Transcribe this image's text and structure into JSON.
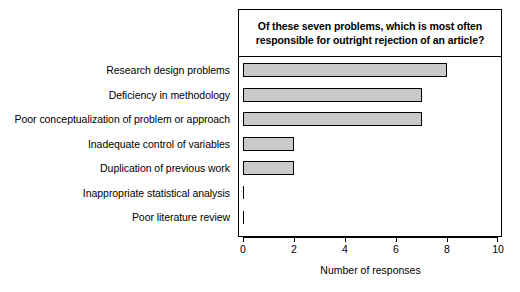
{
  "chart_data": {
    "type": "bar",
    "orientation": "horizontal",
    "title_lines": [
      "Of these seven problems, which is most often",
      "responsible for outright rejection of an article?"
    ],
    "categories": [
      "Research design problems",
      "Deficiency in methodology",
      "Poor conceptualization of problem or approach",
      "Inadequate control of variables",
      "Duplication of previous work",
      "Inappropriate statistical analysis",
      "Poor literature review"
    ],
    "values": [
      8,
      7,
      7,
      2,
      2,
      0,
      0
    ],
    "xlabel": "Number of responses",
    "ylabel": "",
    "xlim": [
      0,
      10
    ],
    "xticks": [
      0,
      2,
      4,
      6,
      8,
      10
    ],
    "xticklabels": [
      "0",
      "2",
      "4",
      "6",
      "8",
      "10"
    ],
    "grid": false,
    "legend": false,
    "bar_fill_color": "#c9c9c9",
    "bar_edge_color": "#000000",
    "background_color": "#ffffff"
  }
}
